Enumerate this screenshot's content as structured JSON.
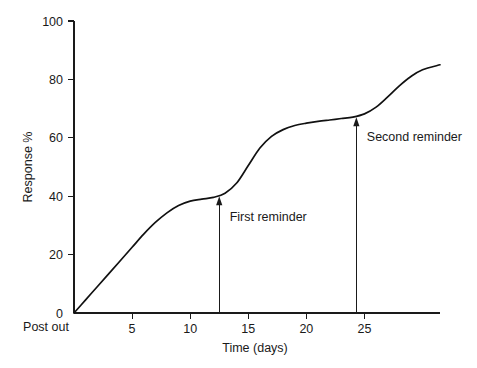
{
  "chart_data": {
    "type": "line",
    "title": "",
    "xlabel": "Time (days)",
    "ylabel": "Response %",
    "xlim": [
      0,
      31.5
    ],
    "ylim": [
      0,
      100
    ],
    "grid": false,
    "legend": "none",
    "x_ticks": [
      5,
      10,
      15,
      20,
      25
    ],
    "x_tick_labels": [
      "5",
      "10",
      "15",
      "20",
      "25"
    ],
    "y_ticks": [
      0,
      20,
      40,
      60,
      80,
      100
    ],
    "y_tick_labels": [
      "0",
      "20",
      "40",
      "60",
      "80",
      "100"
    ],
    "origin_note": "Post out",
    "series": [
      {
        "name": "Cumulative response",
        "x": [
          0,
          1,
          2,
          3,
          4,
          5,
          6,
          7,
          8,
          9,
          10,
          11,
          12,
          13,
          14,
          15,
          16,
          17,
          18,
          19,
          20,
          21,
          22,
          23,
          24,
          25,
          26,
          27,
          28,
          29,
          30,
          31.5
        ],
        "y": [
          0,
          4.5,
          9.0,
          13.5,
          18.0,
          22.5,
          27.0,
          31.0,
          34.3,
          36.8,
          38.3,
          39.0,
          39.6,
          41.0,
          44.5,
          50.5,
          56.5,
          60.5,
          62.8,
          64.2,
          65.0,
          65.6,
          66.1,
          66.6,
          67.1,
          68.2,
          70.5,
          74.0,
          77.8,
          81.0,
          83.3,
          85.0
        ]
      }
    ],
    "annotations": [
      {
        "label": "First reminder",
        "x": 12.5,
        "y_tip": 40.0,
        "y_base": 0,
        "arrow": "up",
        "label_x": 13.4,
        "label_y": 33.0
      },
      {
        "label": "Second reminder",
        "x": 24.3,
        "y_tip": 67.0,
        "y_base": 0,
        "arrow": "up",
        "label_x": 25.2,
        "label_y": 60.5
      }
    ]
  },
  "colors": {
    "curve": "#111111",
    "axis": "#1a1a1a",
    "background": "#ffffff",
    "annotation": "#1a1a1a"
  }
}
